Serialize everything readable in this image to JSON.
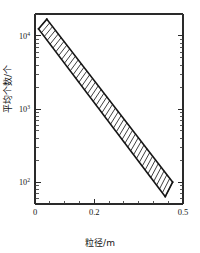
{
  "chart_data": {
    "type": "area",
    "title": "",
    "subtitle": "",
    "xlabel": "粒径/m",
    "ylabel": "平均个数/个",
    "xscale": "linear",
    "yscale": "log",
    "xlim": [
      0,
      0.5
    ],
    "ylim": [
      50,
      20000
    ],
    "grid": false,
    "legend": null,
    "x_ticks": [
      {
        "value": 0,
        "label": "0",
        "major": true
      },
      {
        "value": 0.05,
        "label": "",
        "major": false
      },
      {
        "value": 0.1,
        "label": "",
        "major": false
      },
      {
        "value": 0.15,
        "label": "",
        "major": false
      },
      {
        "value": 0.2,
        "label": "0.2",
        "major": true
      },
      {
        "value": 0.25,
        "label": "",
        "major": false
      },
      {
        "value": 0.3,
        "label": "",
        "major": false
      },
      {
        "value": 0.35,
        "label": "",
        "major": false
      },
      {
        "value": 0.4,
        "label": "",
        "major": false
      },
      {
        "value": 0.45,
        "label": "",
        "major": false
      },
      {
        "value": 0.5,
        "label": "0.5",
        "major": true
      }
    ],
    "y_ticks": [
      {
        "value": 100,
        "mantissa": "10",
        "exponent": "2",
        "major": true
      },
      {
        "value": 1000,
        "mantissa": "10",
        "exponent": "3",
        "major": true
      },
      {
        "value": 10000,
        "mantissa": "10",
        "exponent": "4",
        "major": true
      }
    ],
    "y_minor_ticks": [
      60,
      70,
      80,
      90,
      200,
      300,
      400,
      500,
      600,
      700,
      800,
      900,
      2000,
      3000,
      4000,
      5000,
      6000,
      7000,
      8000,
      9000,
      20000
    ],
    "series": [
      {
        "name": "上边界",
        "role": "upper_bound",
        "x": [
          0.04,
          0.465
        ],
        "y": [
          17000,
          100
        ]
      },
      {
        "name": "下边界",
        "role": "lower_bound",
        "x": [
          0.012,
          0.44
        ],
        "y": [
          12500,
          63
        ]
      }
    ],
    "band": {
      "fill": "hatched",
      "hatch_pattern": "near-vertical-lines",
      "hatch_color": "#1c1c1c",
      "edge_color": "#141414",
      "description": "平均个数随粒径增大呈指数衰减的阴影带"
    },
    "annotations": []
  },
  "axis_style": {
    "frame_color": "#2a2a2a",
    "tick_color": "#2a2a2a",
    "text_color": "#141414",
    "background": "#ffffff"
  }
}
